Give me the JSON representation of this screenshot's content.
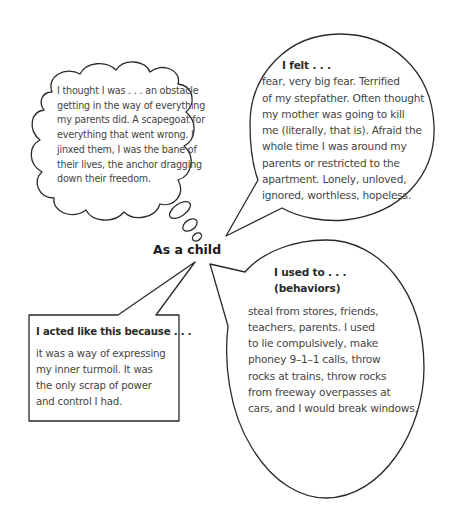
{
  "diagram": {
    "center_label": "As a child",
    "thought_bubble": {
      "shape": "cloud",
      "lines": [
        "I thought I was . . . an obstacle",
        "getting in the way of everything",
        "my parents did. A scapegoat for",
        "everything that went wrong. I",
        "jinxed them, I was the bane of",
        "their lives, the anchor dragging",
        "down their freedom."
      ]
    },
    "felt_bubble": {
      "shape": "round speech bubble",
      "heading": "I felt . . .",
      "lines": [
        "fear, very big fear. Terrified",
        "of my stepfather. Often thought",
        "my mother was going to kill",
        "me (literally, that is). Afraid the",
        "whole time I was around my",
        "parents or restricted to the",
        "apartment. Lonely, unloved,",
        "ignored, worthless, hopeless."
      ]
    },
    "behaviors_bubble": {
      "shape": "oval speech bubble",
      "heading_line1": "I used to . . .",
      "heading_line2": "(behaviors)",
      "lines": [
        "steal from stores, friends,",
        "teachers, parents. I used",
        "to lie compulsively, make",
        "phoney 9–1–1 calls, throw",
        "rocks at trains, throw rocks",
        "from freeway overpasses at",
        "cars, and I would break windows."
      ]
    },
    "because_box": {
      "shape": "rectangular callout",
      "heading": "I acted like this because . . .",
      "lines": [
        "it was a way of expressing",
        "my inner turmoil. It was",
        "the only scrap of power",
        "and control I had."
      ]
    },
    "colors": {
      "outline": "#2a2a2a",
      "text": "#444444",
      "background": "#ffffff"
    }
  }
}
